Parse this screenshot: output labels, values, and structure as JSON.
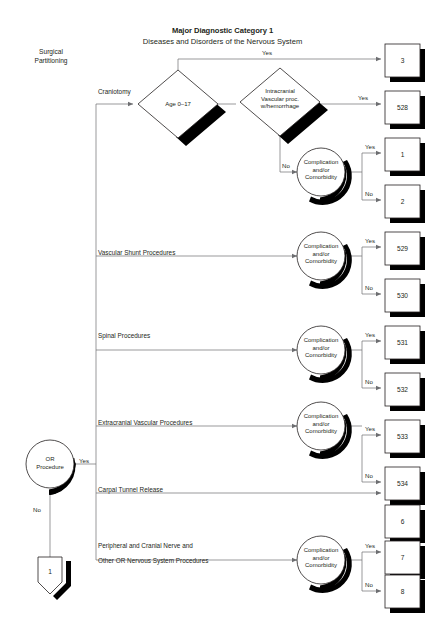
{
  "header": {
    "title": "Major Diagnostic Category 1",
    "subtitle": "Diseases and Disorders of the Nervous System"
  },
  "corner_label": {
    "line1": "Surgical",
    "line2": "Partitioning"
  },
  "entry": {
    "node_line1": "OR",
    "node_line2": "Procedure",
    "yes_label": "Yes",
    "no_label": "No",
    "connector_number": "1"
  },
  "decisions": {
    "age": "Age 0–17",
    "intracranial_line1": "Intracranial",
    "intracranial_line2": "Vascular proc.",
    "intracranial_line3": "w/hemorrhage"
  },
  "cc_node": {
    "line1": "Complication",
    "line2": "and/or",
    "line3": "Comorbidity"
  },
  "labels": {
    "yes": "Yes",
    "no": "No"
  },
  "branches": [
    {
      "id": "craniotomy",
      "label": "Craniotomy"
    },
    {
      "id": "vascular-shunt",
      "label": "Vascular Shunt Procedures"
    },
    {
      "id": "spinal",
      "label": "Spinal Procedures"
    },
    {
      "id": "extracranial-vascular",
      "label": "Extracranial Vascular Procedures"
    },
    {
      "id": "carpal-tunnel",
      "label": "Carpal Tunnel Release"
    },
    {
      "id": "peripheral-cranial-nerve-1",
      "label": "Peripheral and Cranial Nerve and"
    },
    {
      "id": "peripheral-cranial-nerve-2",
      "label": "Other OR Nervous System Procedures"
    }
  ],
  "drg_boxes": [
    {
      "id": "drg-3",
      "number": "3",
      "y": 44
    },
    {
      "id": "drg-528",
      "number": "528",
      "y": 91
    },
    {
      "id": "drg-1",
      "number": "1",
      "y": 138
    },
    {
      "id": "drg-2",
      "number": "2",
      "y": 185
    },
    {
      "id": "drg-529",
      "number": "529",
      "y": 232
    },
    {
      "id": "drg-530",
      "number": "530",
      "y": 279
    },
    {
      "id": "drg-531",
      "number": "531",
      "y": 326
    },
    {
      "id": "drg-532",
      "number": "532",
      "y": 373
    },
    {
      "id": "drg-533",
      "number": "533",
      "y": 420
    },
    {
      "id": "drg-534",
      "number": "534",
      "y": 467
    },
    {
      "id": "drg-6",
      "number": "6",
      "y": 505
    },
    {
      "id": "drg-7",
      "number": "7",
      "y": 541
    },
    {
      "id": "drg-8",
      "number": "8",
      "y": 575
    }
  ],
  "colors": {
    "ink": "#231f20",
    "line": "#6d6e71",
    "shadow": "#000000",
    "fill": "#ffffff"
  }
}
